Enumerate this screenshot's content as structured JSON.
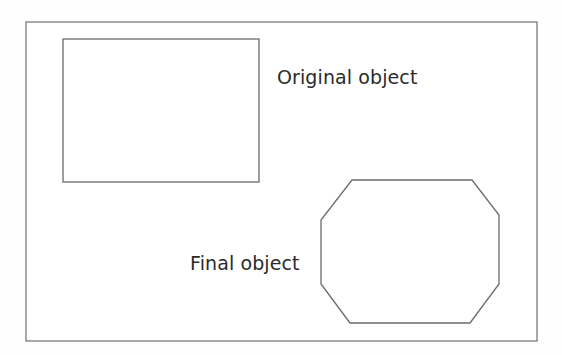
{
  "figure": {
    "type": "line-diagram",
    "background_color": "#fefefe",
    "frame": {
      "name": "diagram-border",
      "x": 26,
      "y": 22,
      "width": 511,
      "height": 319,
      "stroke_color": "#6f6f6f",
      "fill_color": "#ffffff"
    },
    "shapes": [
      {
        "id": "original-object",
        "kind": "rectangle",
        "x": 63,
        "y": 39,
        "width": 196,
        "height": 143,
        "stroke_color": "#6b6b6b",
        "fill_color": "#ffffff"
      },
      {
        "id": "final-object",
        "kind": "octagon",
        "points": "352,180 472,180 499,215 499,284 470,323 350,323 321,284 321,220",
        "stroke_color": "#6b6b6b",
        "fill_color": "#ffffff"
      }
    ],
    "labels": {
      "original": "Original object",
      "final": "Final object"
    },
    "text_color": "#2b2b2b"
  },
  "chart_data": {
    "type": "diagram",
    "title": "",
    "annotations": [
      {
        "text": "Original object",
        "target_shape": "rectangle",
        "x": 277,
        "y": 67
      },
      {
        "text": "Final object",
        "target_shape": "octagon",
        "x": 190,
        "y": 253
      }
    ],
    "shapes": [
      {
        "label": "Original object",
        "geometry": "rectangle",
        "corners": 4,
        "bbox": [
          63,
          39,
          259,
          182
        ]
      },
      {
        "label": "Final object",
        "geometry": "octagon",
        "corners": 8,
        "bbox": [
          321,
          180,
          499,
          323
        ]
      }
    ],
    "xlabel": "",
    "ylabel": "",
    "legend": [],
    "grid": false
  }
}
